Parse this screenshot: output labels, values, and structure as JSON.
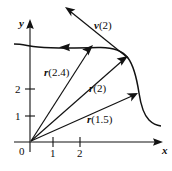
{
  "figure": {
    "background_color": "#ffffff",
    "ink_color": "#121212"
  },
  "axes": {
    "x_label": "x",
    "y_label": "y",
    "origin_label": "0",
    "x_ticks": [
      {
        "label": "1",
        "value": 1
      },
      {
        "label": "2",
        "value": 2
      }
    ],
    "y_ticks": [
      {
        "label": "1",
        "value": 1
      },
      {
        "label": "2",
        "value": 2
      }
    ]
  },
  "vectors": [
    {
      "name": "r-2-4",
      "label_bold": "r",
      "label_args": "(2.4)"
    },
    {
      "name": "r-2",
      "label_bold": "r",
      "label_args": "(2)"
    },
    {
      "name": "r-1-5",
      "label_bold": "r",
      "label_args": "(1.5)"
    },
    {
      "name": "v-2",
      "label_bold": "v",
      "label_args": "(2)"
    }
  ],
  "curve": {
    "name": "trajectory-curve",
    "direction_marker": "left-pointing-arrowhead"
  }
}
